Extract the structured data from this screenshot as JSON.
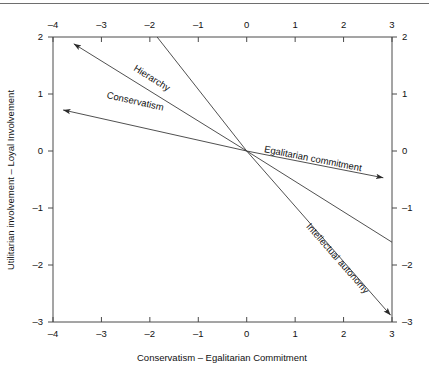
{
  "chart_data": {
    "type": "scatter",
    "title": "",
    "subtitle": "",
    "xlabel": "Conservatism – Egalitarian Commitment",
    "ylabel": "Utilitarian involvement – Loyal Involvement",
    "xlim": [
      -4,
      3
    ],
    "ylim": [
      -3,
      2
    ],
    "xticks": [
      "–4",
      "–3",
      "–2",
      "–1",
      "0",
      "1",
      "2",
      "3"
    ],
    "xtick_values": [
      -4,
      -3,
      -2,
      -1,
      0,
      1,
      2,
      3
    ],
    "yticks": [
      "2",
      "1",
      "0",
      "–1",
      "–2",
      "–3"
    ],
    "ytick_values": [
      2,
      1,
      0,
      -1,
      -2,
      -3
    ],
    "grid": false,
    "legend": "none",
    "mirrored_axes": true,
    "origin": [
      0,
      0
    ],
    "vectors": [
      {
        "name": "hierarchy",
        "label": "Hierarchy",
        "from": [
          0,
          0
        ],
        "to": [
          -3.57,
          1.88
        ],
        "arrowhead": "end",
        "label_position": [
          -2.35,
          1.42
        ]
      },
      {
        "name": "conservatism",
        "label": "Conservatism",
        "from": [
          0,
          0
        ],
        "to": [
          -3.79,
          0.72
        ],
        "arrowhead": "end",
        "label_position": [
          -2.9,
          0.93
        ]
      },
      {
        "name": "egalitarian-commitment",
        "label": "Egalitarian commitment",
        "from": [
          0,
          0
        ],
        "to": [
          2.82,
          -0.47
        ],
        "arrowhead": "end",
        "label_position": [
          0.35,
          -0.02
        ]
      },
      {
        "name": "intellectual-autonomy",
        "label": "Intellectual autonomy",
        "from": [
          0,
          0
        ],
        "to": [
          2.97,
          -2.88
        ],
        "arrowhead": "end",
        "label_position": [
          1.22,
          -1.33
        ]
      },
      {
        "name": "unlabeled-upper-line",
        "label": "",
        "from": [
          0,
          0
        ],
        "to": [
          3.0,
          -1.6
        ],
        "arrowhead": "none",
        "label_position": null
      },
      {
        "name": "unlabeled-top-line",
        "label": "",
        "from": [
          0,
          0
        ],
        "to": [
          -1.85,
          2.0
        ],
        "arrowhead": "none",
        "label_position": null
      }
    ]
  },
  "axes": {
    "x_bottom_label": "Conservatism – Egalitarian Commitment",
    "y_left_label": "Utilitarian involvement – Loyal Involvement"
  },
  "labels": {
    "hierarchy": "Hierarchy",
    "conservatism": "Conservatism",
    "egalitarian_commitment": "Egalitarian commitment",
    "intellectual_autonomy": "Intellectual autonomy"
  },
  "colors": {
    "background": "#ffffff",
    "axis": "#4a4a4a",
    "vector": "#3c3c3c",
    "text": "#111111",
    "rule": "#6e6e6e"
  }
}
